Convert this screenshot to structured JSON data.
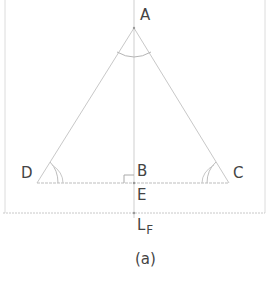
{
  "diagram": {
    "caption": "(a)",
    "points": {
      "A": {
        "label": "A",
        "x": 134,
        "y": 28
      },
      "B": {
        "label": "B",
        "x": 134,
        "y": 183
      },
      "C": {
        "label": "C",
        "x": 229,
        "y": 183
      },
      "D": {
        "label": "D",
        "x": 37,
        "y": 183
      },
      "E": {
        "label": "E",
        "x": 134,
        "y": 183
      }
    },
    "line_label": {
      "main": "L",
      "subscript": "F"
    },
    "colors": {
      "line": "#bdbdbd",
      "frame": "#d6d6d6",
      "text": "#444444"
    }
  }
}
